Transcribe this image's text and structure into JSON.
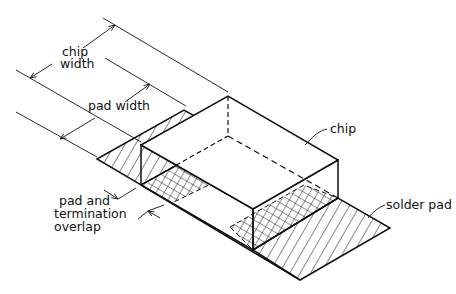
{
  "labels": {
    "chip_width_line1": "chip",
    "chip_width_line2": "width",
    "pad_width": "pad width",
    "chip": "chip",
    "solder_pad": "solder pad",
    "overlap_line1": "pad and",
    "overlap_line2": "termination",
    "overlap_line3": "overlap"
  },
  "colors": {
    "line": "#111111",
    "background": "#ffffff"
  }
}
